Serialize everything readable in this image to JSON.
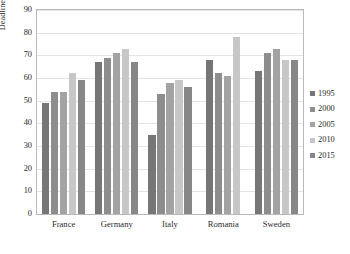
{
  "chart_data": {
    "type": "bar",
    "title": "",
    "xlabel": "",
    "ylabel": "Deadline pressure",
    "ylim": [
      0,
      90
    ],
    "ytick_step": 10,
    "yticks": [
      0,
      10,
      20,
      30,
      40,
      50,
      60,
      70,
      80,
      90
    ],
    "grid": true,
    "legend_position": "right",
    "categories": [
      "France",
      "Germany",
      "Italy",
      "Romania",
      "Sweden"
    ],
    "series": [
      {
        "name": "1995",
        "color": "#767676",
        "values": [
          49,
          67,
          35,
          68,
          63
        ]
      },
      {
        "name": "2000",
        "color": "#8d8d8d",
        "values": [
          54,
          69,
          53,
          62,
          71
        ]
      },
      {
        "name": "2005",
        "color": "#a3a3a3",
        "values": [
          54,
          71,
          58,
          61,
          73
        ]
      },
      {
        "name": "2010",
        "color": "#c7c7c7",
        "values": [
          62,
          73,
          59,
          78,
          68
        ]
      },
      {
        "name": "2015",
        "color": "#878787",
        "values": [
          59,
          67,
          56,
          null,
          68
        ]
      }
    ]
  },
  "axes": {
    "y_label": "Deadline pressure",
    "y_tick_labels": [
      "90",
      "80",
      "70",
      "60",
      "50",
      "40",
      "30",
      "20",
      "10",
      "0"
    ],
    "x_tick_labels": [
      "France",
      "Germany",
      "Italy",
      "Romania",
      "Sweden"
    ]
  },
  "legend": {
    "items": [
      {
        "label": "1995",
        "color": "#767676"
      },
      {
        "label": "2000",
        "color": "#8d8d8d"
      },
      {
        "label": "2005",
        "color": "#a3a3a3"
      },
      {
        "label": "2010",
        "color": "#c7c7c7"
      },
      {
        "label": "2015",
        "color": "#878787"
      }
    ]
  }
}
